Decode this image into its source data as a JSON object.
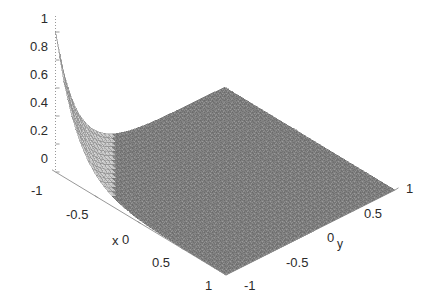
{
  "chart_data": {
    "type": "surface",
    "title": "",
    "xlabel": "x",
    "ylabel": "y",
    "zlabel": "",
    "xlim": [
      -1,
      1
    ],
    "ylim": [
      -1,
      1
    ],
    "zlim": [
      0,
      1
    ],
    "x_ticks": [
      "-1",
      "-0.5",
      "0",
      "0.5",
      "1"
    ],
    "x_tick_values": [
      -1,
      -0.5,
      0,
      0.5,
      1
    ],
    "y_ticks": [
      "-1",
      "-0.5",
      "0",
      "0.5",
      "1"
    ],
    "y_tick_values": [
      -1,
      -0.5,
      0,
      0.5,
      1
    ],
    "z_ticks": [
      "1",
      "0.8",
      "0.6",
      "0.4",
      "0.2",
      "0"
    ],
    "z_tick_values": [
      1,
      0.8,
      0.6,
      0.4,
      0.2,
      0
    ],
    "grid": false,
    "legend": "none",
    "mesh_color": "#808080",
    "mesh_line_color": "#6e6e6e",
    "axis_color": "#8c8c8c",
    "background": "#ffffff",
    "view": {
      "azimuth": -37.5,
      "elevation": 30
    },
    "peak": {
      "x": -1,
      "y": -1,
      "z": 1
    },
    "grid_n": 41,
    "series": [
      {
        "name": "surface",
        "x": [
          -1,
          -0.9,
          -0.8,
          -0.7,
          -0.6,
          -0.5,
          -0.4,
          -0.3,
          -0.2,
          -0.1,
          0,
          0.1,
          0.2,
          0.3,
          0.4,
          0.5,
          0.6,
          0.7,
          0.8,
          0.9,
          1
        ],
        "y": [
          -1,
          -0.9,
          -0.8,
          -0.7,
          -0.6,
          -0.5,
          -0.4,
          -0.3,
          -0.2,
          -0.1,
          0,
          0.1,
          0.2,
          0.3,
          0.4,
          0.5,
          0.6,
          0.7,
          0.8,
          0.9,
          1
        ],
        "z_rows": [
          [
            1.0,
            0.67,
            0.449,
            0.301,
            0.202,
            0.135,
            0.091,
            0.061,
            0.041,
            0.027,
            0.018,
            0.012,
            0.008,
            0.006,
            0.004,
            0.002,
            0.002,
            0.001,
            0.001,
            0.0,
            0.0
          ],
          [
            0.67,
            0.449,
            0.301,
            0.202,
            0.135,
            0.091,
            0.061,
            0.041,
            0.027,
            0.018,
            0.012,
            0.008,
            0.006,
            0.004,
            0.002,
            0.002,
            0.001,
            0.001,
            0.0,
            0.0,
            0.0
          ],
          [
            0.449,
            0.301,
            0.202,
            0.135,
            0.091,
            0.061,
            0.041,
            0.027,
            0.018,
            0.012,
            0.008,
            0.006,
            0.004,
            0.002,
            0.002,
            0.001,
            0.001,
            0.0,
            0.0,
            0.0,
            0.0
          ],
          [
            0.301,
            0.202,
            0.135,
            0.091,
            0.061,
            0.041,
            0.027,
            0.018,
            0.012,
            0.008,
            0.006,
            0.004,
            0.002,
            0.002,
            0.001,
            0.001,
            0.0,
            0.0,
            0.0,
            0.0,
            0.0
          ],
          [
            0.202,
            0.135,
            0.091,
            0.061,
            0.041,
            0.027,
            0.018,
            0.012,
            0.008,
            0.006,
            0.004,
            0.002,
            0.002,
            0.001,
            0.001,
            0.0,
            0.0,
            0.0,
            0.0,
            0.0,
            0.0
          ],
          [
            0.135,
            0.091,
            0.061,
            0.041,
            0.027,
            0.018,
            0.012,
            0.008,
            0.006,
            0.004,
            0.002,
            0.002,
            0.001,
            0.001,
            0.0,
            0.0,
            0.0,
            0.0,
            0.0,
            0.0,
            0.0
          ],
          [
            0.091,
            0.061,
            0.041,
            0.027,
            0.018,
            0.012,
            0.008,
            0.006,
            0.004,
            0.002,
            0.002,
            0.001,
            0.001,
            0.0,
            0.0,
            0.0,
            0.0,
            0.0,
            0.0,
            0.0,
            0.0
          ],
          [
            0.061,
            0.041,
            0.027,
            0.018,
            0.012,
            0.008,
            0.006,
            0.004,
            0.002,
            0.002,
            0.001,
            0.001,
            0.0,
            0.0,
            0.0,
            0.0,
            0.0,
            0.0,
            0.0,
            0.0,
            0.0
          ],
          [
            0.041,
            0.027,
            0.018,
            0.012,
            0.008,
            0.006,
            0.004,
            0.002,
            0.002,
            0.001,
            0.001,
            0.0,
            0.0,
            0.0,
            0.0,
            0.0,
            0.0,
            0.0,
            0.0,
            0.0,
            0.0
          ],
          [
            0.027,
            0.018,
            0.012,
            0.008,
            0.006,
            0.004,
            0.002,
            0.002,
            0.001,
            0.001,
            0.0,
            0.0,
            0.0,
            0.0,
            0.0,
            0.0,
            0.0,
            0.0,
            0.0,
            0.0,
            0.0
          ],
          [
            0.018,
            0.012,
            0.008,
            0.006,
            0.004,
            0.002,
            0.002,
            0.001,
            0.001,
            0.0,
            0.0,
            0.0,
            0.0,
            0.0,
            0.0,
            0.0,
            0.0,
            0.0,
            0.0,
            0.0,
            0.0
          ],
          [
            0.012,
            0.008,
            0.006,
            0.004,
            0.002,
            0.002,
            0.001,
            0.001,
            0.0,
            0.0,
            0.0,
            0.0,
            0.0,
            0.0,
            0.0,
            0.0,
            0.0,
            0.0,
            0.0,
            0.0,
            0.0
          ],
          [
            0.008,
            0.006,
            0.004,
            0.002,
            0.002,
            0.001,
            0.001,
            0.0,
            0.0,
            0.0,
            0.0,
            0.0,
            0.0,
            0.0,
            0.0,
            0.0,
            0.0,
            0.0,
            0.0,
            0.0,
            0.0
          ],
          [
            0.006,
            0.004,
            0.002,
            0.002,
            0.001,
            0.001,
            0.0,
            0.0,
            0.0,
            0.0,
            0.0,
            0.0,
            0.0,
            0.0,
            0.0,
            0.0,
            0.0,
            0.0,
            0.0,
            0.0,
            0.0
          ],
          [
            0.004,
            0.002,
            0.002,
            0.001,
            0.001,
            0.0,
            0.0,
            0.0,
            0.0,
            0.0,
            0.0,
            0.0,
            0.0,
            0.0,
            0.0,
            0.0,
            0.0,
            0.0,
            0.0,
            0.0,
            0.0
          ],
          [
            0.002,
            0.002,
            0.001,
            0.001,
            0.0,
            0.0,
            0.0,
            0.0,
            0.0,
            0.0,
            0.0,
            0.0,
            0.0,
            0.0,
            0.0,
            0.0,
            0.0,
            0.0,
            0.0,
            0.0,
            0.0
          ],
          [
            0.002,
            0.001,
            0.001,
            0.0,
            0.0,
            0.0,
            0.0,
            0.0,
            0.0,
            0.0,
            0.0,
            0.0,
            0.0,
            0.0,
            0.0,
            0.0,
            0.0,
            0.0,
            0.0,
            0.0,
            0.0
          ],
          [
            0.001,
            0.001,
            0.0,
            0.0,
            0.0,
            0.0,
            0.0,
            0.0,
            0.0,
            0.0,
            0.0,
            0.0,
            0.0,
            0.0,
            0.0,
            0.0,
            0.0,
            0.0,
            0.0,
            0.0,
            0.0
          ],
          [
            0.001,
            0.0,
            0.0,
            0.0,
            0.0,
            0.0,
            0.0,
            0.0,
            0.0,
            0.0,
            0.0,
            0.0,
            0.0,
            0.0,
            0.0,
            0.0,
            0.0,
            0.0,
            0.0,
            0.0,
            0.0
          ],
          [
            0.0,
            0.0,
            0.0,
            0.0,
            0.0,
            0.0,
            0.0,
            0.0,
            0.0,
            0.0,
            0.0,
            0.0,
            0.0,
            0.0,
            0.0,
            0.0,
            0.0,
            0.0,
            0.0,
            0.0,
            0.0
          ],
          [
            0.0,
            0.0,
            0.0,
            0.0,
            0.0,
            0.0,
            0.0,
            0.0,
            0.0,
            0.0,
            0.0,
            0.0,
            0.0,
            0.0,
            0.0,
            0.0,
            0.0,
            0.0,
            0.0,
            0.0,
            0.0
          ]
        ]
      }
    ]
  },
  "geometry": {
    "corner_left": [
      55.5,
      172.0
    ],
    "corner_front": [
      226.0,
      275.0
    ],
    "corner_right": [
      395.0,
      190.0
    ],
    "corner_back": [
      224.0,
      96.0
    ],
    "z_top_left": [
      55.5,
      16.0
    ],
    "z_unit_px": 140.0,
    "z_zero_y": 158.0
  }
}
